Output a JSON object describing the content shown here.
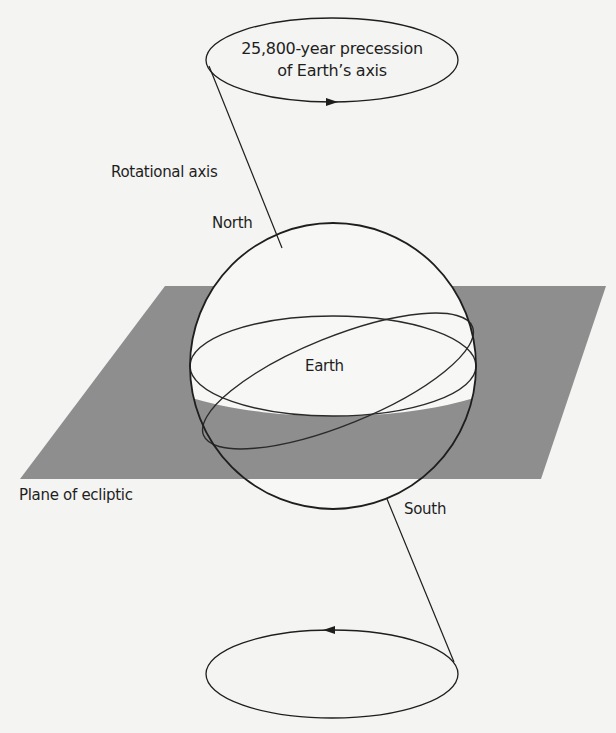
{
  "diagram": {
    "labels": {
      "precession_line1": "25,800-year precession",
      "precession_line2": "of Earth’s axis",
      "rotational_axis": "Rotational axis",
      "north": "North",
      "earth": "Earth",
      "plane": "Plane of ecliptic",
      "south": "South"
    },
    "colors": {
      "background": "#f4f4f2",
      "plane": "#8e8e8e",
      "sphere_fill": "#f7f7f5",
      "stroke": "#1e1e1e"
    }
  }
}
